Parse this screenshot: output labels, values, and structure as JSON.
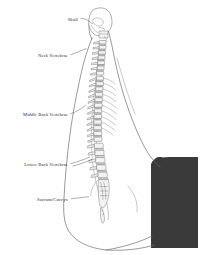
{
  "figure": {
    "background_color": "#ffffff",
    "line_color": "#5a5a5a",
    "text_color": "#2b2b2b",
    "shade_block_color": "#3a3a3a",
    "width": 202,
    "height": 255
  },
  "labels": [
    {
      "id": "skull",
      "text": "Skull",
      "x": 78,
      "y": 19,
      "leader_to_x": 96,
      "leader_to_y": 26
    },
    {
      "id": "neck",
      "text": "Neck Vertebrae",
      "x": 68,
      "y": 55,
      "leader_to_x": 88,
      "leader_to_y": 49
    },
    {
      "id": "middle-back",
      "text": "Middle Back Vertebrae",
      "x": 68,
      "y": 114,
      "leader_to_x": 90,
      "leader_to_y": 104
    },
    {
      "id": "lower-back",
      "text": "Lower Back Vertebrae",
      "x": 68,
      "y": 164,
      "leader_to_x": 96,
      "leader_to_y": 156
    },
    {
      "id": "sacrum-coccyx",
      "text": "Sacrum/Coccyx",
      "x": 68,
      "y": 199,
      "leader_to_x": 92,
      "leader_to_y": 196
    }
  ],
  "regions": [
    {
      "id": "cervical",
      "label": "Neck Vertebrae",
      "count": 7,
      "note": "cervical curve"
    },
    {
      "id": "thoracic",
      "label": "Middle Back Vertebrae",
      "count": 12,
      "note": "thoracic curve"
    },
    {
      "id": "lumbar",
      "label": "Lower Back Vertebrae",
      "count": 5,
      "note": "lumbar curve"
    },
    {
      "id": "sacral",
      "label": "Sacrum/Coccyx",
      "count": 1,
      "note": "fused sacrum and coccyx"
    }
  ]
}
